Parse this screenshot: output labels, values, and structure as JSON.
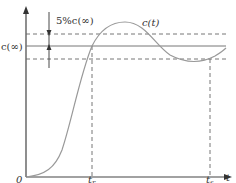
{
  "diagram": {
    "labels": {
      "tolerance": "5%c(∞)",
      "curve": "c(t)",
      "steady_state": "c(∞)",
      "origin": "0",
      "rise_time": "t",
      "rise_time_sub": "r",
      "settling_time": "t",
      "settling_time_sub": "s",
      "time_axis": "t"
    },
    "colors": {
      "axis": "#444444",
      "curve": "#999999",
      "dashed": "#666666",
      "steady_line": "#777777"
    }
  }
}
